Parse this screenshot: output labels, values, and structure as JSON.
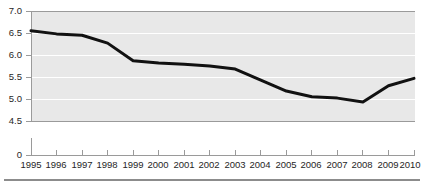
{
  "chart_data": {
    "type": "line",
    "title": "",
    "xlabel": "",
    "ylabel": "",
    "categories": [
      "1995",
      "1996",
      "1997",
      "1998",
      "1999",
      "2000",
      "2001",
      "2002",
      "2003",
      "2004",
      "2005",
      "2006",
      "2007",
      "2008",
      "2009",
      "2010"
    ],
    "values": [
      6.55,
      6.48,
      6.45,
      6.27,
      5.87,
      5.82,
      5.79,
      5.75,
      5.68,
      5.43,
      5.18,
      5.05,
      5.02,
      4.93,
      5.3,
      5.47
    ],
    "series": [
      {
        "name": "series-1",
        "values": [
          6.55,
          6.48,
          6.45,
          6.27,
          5.87,
          5.82,
          5.79,
          5.75,
          5.68,
          5.43,
          5.18,
          5.05,
          5.02,
          4.93,
          5.3,
          5.47
        ]
      }
    ],
    "ytick_labels": [
      "7.0",
      "6.5",
      "6.0",
      "5.5",
      "5.0",
      "4.5",
      "0"
    ],
    "ytick_values": [
      7.0,
      6.5,
      6.0,
      5.5,
      5.0,
      4.5,
      0
    ],
    "xtick_labels": [
      "1995",
      "1996",
      "1997",
      "1998",
      "1999",
      "2000",
      "2001",
      "2002",
      "2003",
      "2004",
      "2005",
      "2006",
      "2007",
      "2008",
      "2009",
      "2010"
    ],
    "ylim": [
      4.5,
      7.0
    ],
    "axis_broken_below": 4.5,
    "grid": true,
    "legend": "none",
    "line_color": "#111111",
    "plot_background_color": "#e8e8e8",
    "gridline_color": "#ffffff",
    "axis_color": "#9a9a9a"
  },
  "footer": {
    "caption": ""
  }
}
